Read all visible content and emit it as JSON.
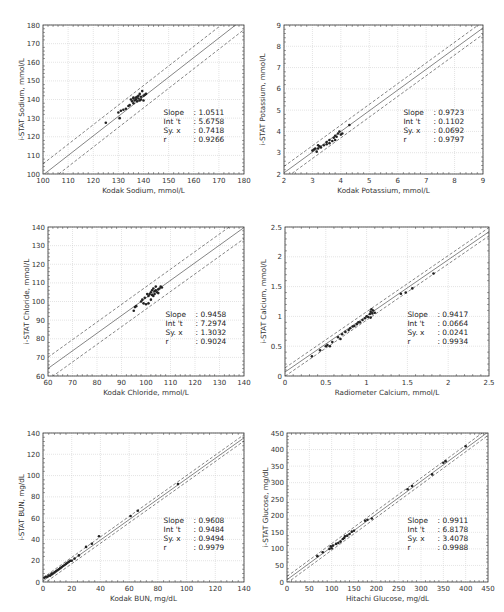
{
  "chart_data": [
    {
      "id": "sodium",
      "type": "scatter",
      "title": "",
      "xlabel": "Kodak Sodium, mmol/L",
      "ylabel": "i-STAT Sodium, mmol/L",
      "xlim": [
        100,
        180
      ],
      "ylim": [
        100,
        180
      ],
      "xticks": [
        100,
        110,
        120,
        130,
        140,
        150,
        160,
        170,
        180
      ],
      "yticks": [
        100,
        110,
        120,
        130,
        140,
        150,
        160,
        170,
        180
      ],
      "grid": true,
      "stats": {
        "slope": "1.0511",
        "intercept": "5.6758",
        "syx": "0.7418",
        "r": "0.9266"
      },
      "fit": {
        "slope": 1.0511,
        "intercept": -5.6758,
        "band": 6.0
      },
      "points": [
        [
          125,
          127.5
        ],
        [
          130,
          133
        ],
        [
          130.5,
          130
        ],
        [
          131,
          134
        ],
        [
          132,
          134.5
        ],
        [
          133,
          135
        ],
        [
          134,
          136.5
        ],
        [
          134.5,
          137
        ],
        [
          135,
          140
        ],
        [
          135.5,
          139
        ],
        [
          136,
          140.5
        ],
        [
          136,
          141
        ],
        [
          136.5,
          139.5
        ],
        [
          137,
          140
        ],
        [
          137,
          141
        ],
        [
          137.5,
          139
        ],
        [
          138,
          140.5
        ],
        [
          138,
          142
        ],
        [
          138.5,
          139.5
        ],
        [
          139,
          140
        ],
        [
          139,
          141.5
        ],
        [
          139.5,
          144.5
        ],
        [
          140,
          142
        ],
        [
          140.5,
          142.5
        ],
        [
          141,
          143
        ],
        [
          136,
          138
        ],
        [
          137.5,
          141.5
        ],
        [
          138.5,
          143
        ],
        [
          140,
          139.5
        ]
      ]
    },
    {
      "id": "potassium",
      "type": "scatter",
      "title": "",
      "xlabel": "Kodak Potassium, mmol/L",
      "ylabel": "i-STAT Potassium, mmol/L",
      "xlim": [
        2,
        9
      ],
      "ylim": [
        2,
        9
      ],
      "xticks": [
        2,
        3,
        4,
        5,
        6,
        7,
        8,
        9
      ],
      "yticks": [
        2,
        3,
        4,
        5,
        6,
        7,
        8,
        9
      ],
      "grid": true,
      "stats": {
        "slope": "0.9723",
        "intercept": "0.1102",
        "syx": "0.0692",
        "r": "0.9797"
      },
      "fit": {
        "slope": 0.9723,
        "intercept": 0.1102,
        "band": 0.3
      },
      "points": [
        [
          3.0,
          3.1
        ],
        [
          3.05,
          3.15
        ],
        [
          3.1,
          3.2
        ],
        [
          3.15,
          3.05
        ],
        [
          3.2,
          3.2
        ],
        [
          3.25,
          3.3
        ],
        [
          3.3,
          3.25
        ],
        [
          3.4,
          3.35
        ],
        [
          3.5,
          3.5
        ],
        [
          3.5,
          3.4
        ],
        [
          3.6,
          3.6
        ],
        [
          3.7,
          3.55
        ],
        [
          3.75,
          3.7
        ],
        [
          3.8,
          3.8
        ],
        [
          3.85,
          3.75
        ],
        [
          3.9,
          3.9
        ],
        [
          3.95,
          4.0
        ],
        [
          4.0,
          3.85
        ],
        [
          4.05,
          3.9
        ],
        [
          3.8,
          3.6
        ],
        [
          4.3,
          4.3
        ],
        [
          3.2,
          3.35
        ],
        [
          3.6,
          3.45
        ]
      ]
    },
    {
      "id": "chloride",
      "type": "scatter",
      "title": "",
      "xlabel": "Kodak Chloride, mmol/L",
      "ylabel": "i-STAT Chloride, mmol/L",
      "xlim": [
        60,
        140
      ],
      "ylim": [
        60,
        140
      ],
      "xticks": [
        60,
        70,
        80,
        90,
        100,
        110,
        120,
        130,
        140
      ],
      "yticks": [
        60,
        70,
        80,
        90,
        100,
        110,
        120,
        130,
        140
      ],
      "grid": true,
      "stats": {
        "slope": "0.9458",
        "intercept": "7.2974",
        "syx": "1.3032",
        "r": "0.9024"
      },
      "fit": {
        "slope": 0.9458,
        "intercept": 7.2974,
        "band": 6.0
      },
      "points": [
        [
          95,
          95
        ],
        [
          95.5,
          97
        ],
        [
          96,
          97.5
        ],
        [
          98,
          100
        ],
        [
          98.5,
          101
        ],
        [
          99,
          99
        ],
        [
          99.5,
          102
        ],
        [
          100,
          98.5
        ],
        [
          100.5,
          104
        ],
        [
          101,
          103
        ],
        [
          101.5,
          104
        ],
        [
          102,
          101
        ],
        [
          102,
          105
        ],
        [
          102.5,
          106
        ],
        [
          103,
          103
        ],
        [
          103,
          107
        ],
        [
          103.5,
          104
        ],
        [
          104,
          106
        ],
        [
          104,
          108
        ],
        [
          104.5,
          105
        ],
        [
          105,
          106.5
        ],
        [
          105.5,
          107
        ],
        [
          106,
          108
        ],
        [
          106.5,
          107.5
        ],
        [
          101,
          99
        ],
        [
          102.5,
          103.5
        ],
        [
          103.5,
          105.5
        ],
        [
          105,
          104.5
        ]
      ]
    },
    {
      "id": "calcium",
      "type": "scatter",
      "title": "",
      "xlabel": "Radiometer Calcium, mmol/L",
      "ylabel": "i-STAT Calcium, mmol/L",
      "xlim": [
        0,
        2.5
      ],
      "ylim": [
        0,
        2.5
      ],
      "xticks": [
        0,
        0.5,
        1,
        1.5,
        2,
        2.5
      ],
      "yticks": [
        0,
        0.5,
        1,
        1.5,
        2,
        2.5
      ],
      "grid": true,
      "stats": {
        "slope": "0.9417",
        "intercept": "0.0664",
        "syx": "0.0241",
        "r": "0.9934"
      },
      "fit": {
        "slope": 0.9417,
        "intercept": 0.0664,
        "band": 0.07
      },
      "points": [
        [
          0.33,
          0.33
        ],
        [
          0.43,
          0.43
        ],
        [
          0.5,
          0.5
        ],
        [
          0.52,
          0.52
        ],
        [
          0.55,
          0.5
        ],
        [
          0.58,
          0.57
        ],
        [
          0.65,
          0.65
        ],
        [
          0.68,
          0.62
        ],
        [
          0.7,
          0.7
        ],
        [
          0.74,
          0.74
        ],
        [
          0.78,
          0.77
        ],
        [
          0.8,
          0.8
        ],
        [
          0.83,
          0.83
        ],
        [
          0.85,
          0.84
        ],
        [
          0.88,
          0.87
        ],
        [
          0.9,
          0.9
        ],
        [
          0.92,
          0.9
        ],
        [
          0.95,
          0.94
        ],
        [
          0.98,
          0.97
        ],
        [
          1.0,
          1.0
        ],
        [
          1.02,
          0.99
        ],
        [
          1.04,
          1.04
        ],
        [
          1.05,
          1.08
        ],
        [
          1.06,
          1.12
        ],
        [
          1.07,
          1.05
        ],
        [
          1.08,
          1.1
        ],
        [
          1.1,
          1.06
        ],
        [
          1.05,
          0.98
        ],
        [
          1.42,
          1.38
        ],
        [
          1.48,
          1.4
        ],
        [
          1.56,
          1.47
        ],
        [
          1.82,
          1.72
        ]
      ]
    },
    {
      "id": "bun",
      "type": "scatter",
      "title": "",
      "xlabel": "Kodak BUN, mg/dL",
      "ylabel": "i-STAT BUN, mg/dL",
      "xlim": [
        0,
        140
      ],
      "ylim": [
        0,
        140
      ],
      "xticks": [
        0,
        20,
        40,
        60,
        80,
        100,
        120,
        140
      ],
      "yticks": [
        0,
        20,
        40,
        60,
        80,
        100,
        120,
        140
      ],
      "grid": true,
      "stats": {
        "slope": "0.9608",
        "intercept": "0.9484",
        "syx": "0.9494",
        "r": "0.9979"
      },
      "fit": {
        "slope": 0.9608,
        "intercept": 0.9484,
        "band": 3.0
      },
      "points": [
        [
          1,
          4
        ],
        [
          2,
          5
        ],
        [
          3,
          5
        ],
        [
          4,
          6
        ],
        [
          5,
          6
        ],
        [
          6,
          7
        ],
        [
          6,
          8
        ],
        [
          7,
          8
        ],
        [
          8,
          9
        ],
        [
          9,
          10
        ],
        [
          10,
          11
        ],
        [
          11,
          12
        ],
        [
          12,
          13
        ],
        [
          13,
          14
        ],
        [
          14,
          15
        ],
        [
          15,
          16
        ],
        [
          16,
          17
        ],
        [
          17,
          18
        ],
        [
          18,
          19
        ],
        [
          19,
          20
        ],
        [
          20,
          20
        ],
        [
          22,
          22
        ],
        [
          25,
          25
        ],
        [
          30,
          33
        ],
        [
          34,
          36
        ],
        [
          39,
          43
        ],
        [
          61,
          62
        ],
        [
          66,
          67
        ],
        [
          94,
          92
        ]
      ]
    },
    {
      "id": "glucose",
      "type": "scatter",
      "title": "",
      "xlabel": "Hitachi Glucose, mg/dL",
      "ylabel": "i-STAT Glucose, mg/dL",
      "xlim": [
        0,
        450
      ],
      "ylim": [
        0,
        450
      ],
      "xticks": [
        0,
        50,
        100,
        150,
        200,
        250,
        300,
        350,
        400,
        450
      ],
      "yticks": [
        0,
        50,
        100,
        150,
        200,
        250,
        300,
        350,
        400,
        450
      ],
      "grid": true,
      "stats": {
        "slope": "0.9911",
        "intercept": "6.8178",
        "syx": "3.4078",
        "r": "0.9988"
      },
      "fit": {
        "slope": 0.9911,
        "intercept": 6.8178,
        "band": 10.0
      },
      "points": [
        [
          68,
          78
        ],
        [
          80,
          90
        ],
        [
          95,
          100
        ],
        [
          98,
          108
        ],
        [
          100,
          102
        ],
        [
          103,
          110
        ],
        [
          110,
          115
        ],
        [
          115,
          118
        ],
        [
          120,
          122
        ],
        [
          125,
          130
        ],
        [
          128,
          133
        ],
        [
          130,
          138
        ],
        [
          135,
          140
        ],
        [
          140,
          145
        ],
        [
          145,
          152
        ],
        [
          150,
          155
        ],
        [
          175,
          185
        ],
        [
          180,
          188
        ],
        [
          190,
          192
        ],
        [
          270,
          280
        ],
        [
          280,
          290
        ],
        [
          325,
          325
        ],
        [
          350,
          360
        ],
        [
          355,
          365
        ],
        [
          400,
          410
        ]
      ]
    }
  ]
}
